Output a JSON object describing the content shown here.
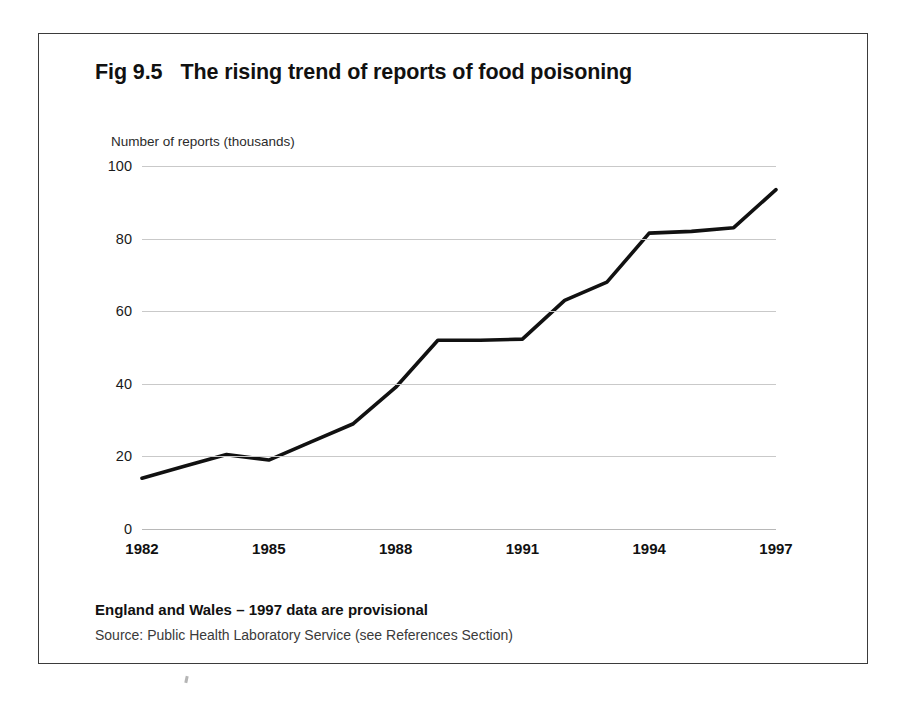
{
  "figure": {
    "number": "Fig 9.5",
    "title": "The rising trend of reports of food poisoning",
    "footnote": "England and Wales – 1997 data are provisional",
    "source": "Source: Public Health Laboratory Service (see References Section)"
  },
  "chart_data": {
    "type": "line",
    "title": "The rising trend of reports of food poisoning",
    "subtitle": "",
    "xlabel": "",
    "ylabel": "Number of reports (thousands)",
    "x": [
      1982,
      1983,
      1984,
      1985,
      1986,
      1987,
      1988,
      1989,
      1990,
      1991,
      1992,
      1993,
      1994,
      1995,
      1996,
      1997
    ],
    "values": [
      14,
      17.3,
      20.5,
      19,
      24,
      29,
      39,
      52,
      52,
      52.3,
      63,
      68,
      81.5,
      82,
      83,
      93.5
    ],
    "series": [
      {
        "name": "Reports of food poisoning",
        "values": [
          14,
          17.3,
          20.5,
          19,
          24,
          29,
          39,
          52,
          52,
          52.3,
          63,
          68,
          81.5,
          82,
          83,
          93.5
        ]
      }
    ],
    "xlim": [
      1982,
      1997
    ],
    "ylim": [
      0,
      100
    ],
    "ytick_labels": [
      "0",
      "20",
      "40",
      "60",
      "80",
      "100"
    ],
    "ytick_values": [
      0,
      20,
      40,
      60,
      80,
      100
    ],
    "xtick_labels": [
      "1982",
      "1985",
      "1988",
      "1991",
      "1994",
      "1997"
    ],
    "xtick_values": [
      1982,
      1985,
      1988,
      1991,
      1994,
      1997
    ],
    "grid": "horizontal",
    "legend": "none",
    "line_color": "#111111",
    "gridline_color": "#c9c9c9"
  }
}
